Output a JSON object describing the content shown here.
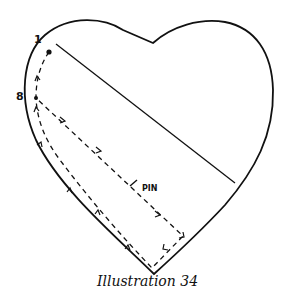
{
  "figure": {
    "caption": "Illustration 34",
    "labels": {
      "point_1": "1",
      "point_8": "8",
      "pin": "PIN"
    },
    "colors": {
      "ink": "#111111",
      "background": "#ffffff"
    }
  }
}
